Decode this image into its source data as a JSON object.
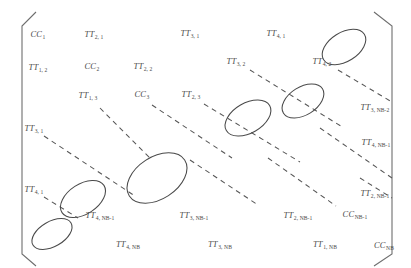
{
  "figure": {
    "bracket_color": "#6e6e6e",
    "text_color": "#4a4a4a",
    "dash_color": "#565656",
    "background": "#ffffff"
  },
  "entries": [
    {
      "base": "CC",
      "sub": "1",
      "x": 38,
      "y": 35
    },
    {
      "base": "TT",
      "sub": "2, 1",
      "x": 94,
      "y": 35
    },
    {
      "base": "TT",
      "sub": "3, 1",
      "x": 190,
      "y": 34
    },
    {
      "base": "TT",
      "sub": "4, 1",
      "x": 276,
      "y": 34
    },
    {
      "base": "TT",
      "sub": "1, 2",
      "x": 38,
      "y": 68
    },
    {
      "base": "CC",
      "sub": "2",
      "x": 92,
      "y": 67
    },
    {
      "base": "TT",
      "sub": "2, 2",
      "x": 143,
      "y": 67
    },
    {
      "base": "TT",
      "sub": "3, 2",
      "x": 236,
      "y": 62
    },
    {
      "base": "TT",
      "sub": "4, 2",
      "x": 322,
      "y": 62
    },
    {
      "base": "TT",
      "sub": "1, 3",
      "x": 88,
      "y": 96
    },
    {
      "base": "CC",
      "sub": "3",
      "x": 142,
      "y": 95
    },
    {
      "base": "TT",
      "sub": "2, 3",
      "x": 191,
      "y": 95
    },
    {
      "base": "TT",
      "sub": "3, NB-2",
      "x": 375,
      "y": 108
    },
    {
      "base": "TT",
      "sub": "3, 1",
      "x": 34,
      "y": 129
    },
    {
      "base": "TT",
      "sub": "4, NB-1",
      "x": 376,
      "y": 143
    },
    {
      "base": "TT",
      "sub": "4, 1",
      "x": 34,
      "y": 190
    },
    {
      "base": "TT",
      "sub": "2, NB-1",
      "x": 375,
      "y": 194
    },
    {
      "base": "TT",
      "sub": "4, NB-1",
      "x": 100,
      "y": 216
    },
    {
      "base": "TT",
      "sub": "3, NB-1",
      "x": 194,
      "y": 216
    },
    {
      "base": "TT",
      "sub": "2, NB-1",
      "x": 298,
      "y": 216
    },
    {
      "base": "CC",
      "sub": "NB-1",
      "x": 355,
      "y": 215
    },
    {
      "base": "TT",
      "sub": "4, NB",
      "x": 128,
      "y": 245
    },
    {
      "base": "TT",
      "sub": "3, NB",
      "x": 220,
      "y": 245
    },
    {
      "base": "TT",
      "sub": "1, NB",
      "x": 325,
      "y": 245
    },
    {
      "base": "CC",
      "sub": "NB",
      "x": 384,
      "y": 246
    }
  ],
  "ellipses": [
    {
      "cx": 344,
      "cy": 47,
      "rx": 24,
      "ry": 14.5,
      "rot": -32,
      "name": "cluster-ellipse-top-right"
    },
    {
      "cx": 303,
      "cy": 101,
      "rx": 23,
      "ry": 14,
      "rot": -32,
      "name": "cluster-ellipse-upper-mid"
    },
    {
      "cx": 248,
      "cy": 118,
      "rx": 25,
      "ry": 15,
      "rot": -30,
      "name": "cluster-ellipse-center-right"
    },
    {
      "cx": 157,
      "cy": 178,
      "rx": 33,
      "ry": 21,
      "rot": -33,
      "name": "cluster-ellipse-center-large"
    },
    {
      "cx": 83,
      "cy": 199,
      "rx": 25,
      "ry": 15,
      "rot": -33,
      "name": "cluster-ellipse-lower-left"
    },
    {
      "cx": 52,
      "cy": 234,
      "rx": 22,
      "ry": 12.5,
      "rot": -30,
      "name": "cluster-ellipse-bottom-left"
    }
  ],
  "dashed_lines": [
    {
      "x1": 100,
      "y1": 108,
      "x2": 152,
      "y2": 160,
      "name": "ellipsis-diagonal-1"
    },
    {
      "x1": 152,
      "y1": 105,
      "x2": 232,
      "y2": 158,
      "name": "ellipsis-diagonal-2"
    },
    {
      "x1": 204,
      "y1": 104,
      "x2": 300,
      "y2": 162,
      "name": "ellipsis-diagonal-3"
    },
    {
      "x1": 250,
      "y1": 70,
      "x2": 344,
      "y2": 128,
      "name": "ellipsis-diagonal-4"
    },
    {
      "x1": 338,
      "y1": 70,
      "x2": 392,
      "y2": 102,
      "name": "ellipsis-diagonal-5"
    },
    {
      "x1": 44,
      "y1": 136,
      "x2": 135,
      "y2": 196,
      "name": "ellipsis-diagonal-6"
    },
    {
      "x1": 44,
      "y1": 197,
      "x2": 78,
      "y2": 218,
      "name": "ellipsis-diagonal-7"
    },
    {
      "x1": 190,
      "y1": 160,
      "x2": 258,
      "y2": 205,
      "name": "ellipsis-diagonal-8"
    },
    {
      "x1": 268,
      "y1": 158,
      "x2": 336,
      "y2": 206,
      "name": "ellipsis-diagonal-9"
    },
    {
      "x1": 320,
      "y1": 128,
      "x2": 392,
      "y2": 178,
      "name": "ellipsis-diagonal-10"
    },
    {
      "x1": 360,
      "y1": 178,
      "x2": 392,
      "y2": 198,
      "name": "ellipsis-diagonal-11"
    }
  ],
  "brackets": {
    "left_path": "M 36 12 L 22 26 L 22 254 L 36 266",
    "right_path": "M 374 12 L 392 26 L 392 254 L 374 266"
  }
}
